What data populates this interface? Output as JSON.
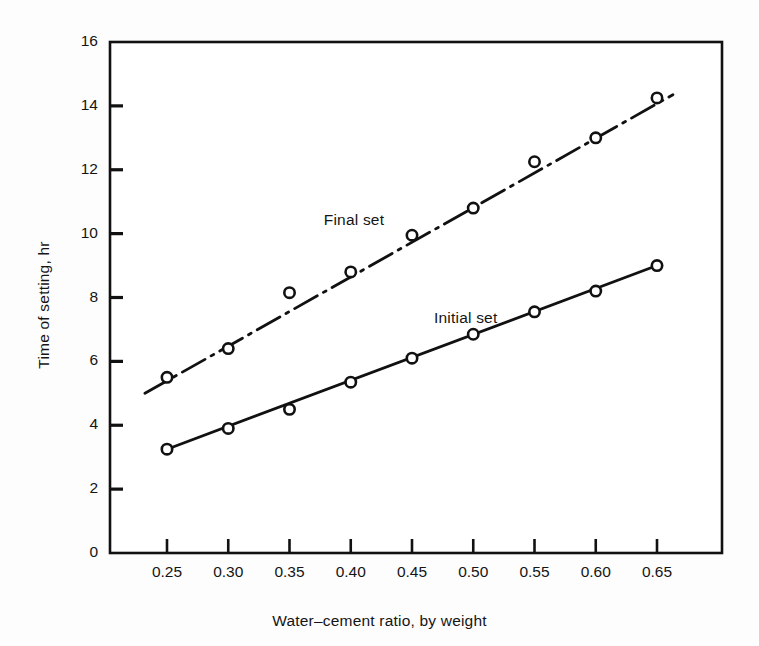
{
  "chart_data": {
    "type": "line",
    "title": "",
    "xlabel": "Water–cement ratio, by weight",
    "ylabel": "Time of setting, hr",
    "x": [
      0.25,
      0.3,
      0.35,
      0.4,
      0.45,
      0.5,
      0.55,
      0.6,
      0.65
    ],
    "xtick_labels": [
      "0.25",
      "0.30",
      "0.35",
      "0.40",
      "0.45",
      "0.50",
      "0.55",
      "0.60",
      "0.65"
    ],
    "ytick_labels": [
      "0",
      "2",
      "4",
      "6",
      "8",
      "10",
      "12",
      "14",
      "16"
    ],
    "ytick_values": [
      0,
      2,
      4,
      6,
      8,
      10,
      12,
      14,
      16
    ],
    "xlim": [
      0.23,
      0.67
    ],
    "ylim": [
      0,
      16
    ],
    "grid": false,
    "legend_position": "inline-annotation",
    "series": [
      {
        "name": "Final set",
        "values": [
          5.5,
          6.4,
          8.15,
          8.8,
          9.95,
          10.8,
          12.25,
          13.0,
          14.25
        ],
        "line_style": "dash-dot",
        "marker": "open-circle",
        "color": "#111111",
        "fit_start": [
          0.232,
          5.0
        ],
        "fit_end": [
          0.663,
          14.35
        ],
        "annotation": {
          "text": "Final set",
          "x": 0.378,
          "y": 10.35
        }
      },
      {
        "name": "Initial set",
        "values": [
          3.25,
          3.9,
          4.5,
          5.35,
          6.1,
          6.85,
          7.55,
          8.2,
          9.0
        ],
        "line_style": "solid",
        "marker": "open-circle",
        "color": "#111111",
        "fit_start": [
          0.25,
          3.25
        ],
        "fit_end": [
          0.65,
          9.0
        ],
        "annotation": {
          "text": "Initial set",
          "x": 0.468,
          "y": 7.3
        }
      }
    ]
  },
  "axes": {
    "frame_color": "#111111",
    "tick_color": "#111111",
    "background": "#ffffff"
  }
}
